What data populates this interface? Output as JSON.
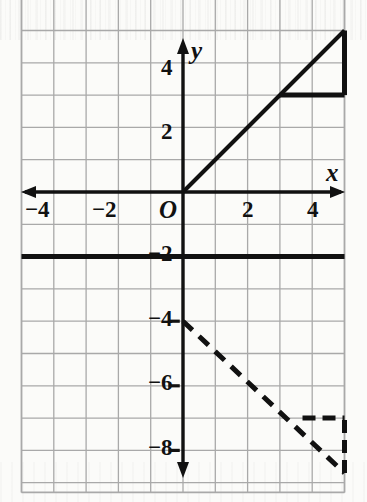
{
  "figure": {
    "kind": "coordinate-plane-graph",
    "background_color": "#fbfbf9",
    "ink_color": "#111111",
    "grid_color": "#a9a9a9"
  },
  "axes": {
    "x_axis_label": "x",
    "y_axis_label": "y",
    "origin_label": "O",
    "x_tick_labels": [
      {
        "text": "−4",
        "value": -4
      },
      {
        "text": "−2",
        "value": -2
      },
      {
        "text": "2",
        "value": 2
      },
      {
        "text": "4",
        "value": 4
      }
    ],
    "y_tick_labels": [
      {
        "text": "4",
        "value": 4
      },
      {
        "text": "2",
        "value": 2
      },
      {
        "text": "−2",
        "value": -2
      },
      {
        "text": "−4",
        "value": -4
      },
      {
        "text": "−6",
        "value": -6
      },
      {
        "text": "−8",
        "value": -8
      }
    ]
  },
  "chart_data": {
    "type": "line",
    "title": "",
    "xlabel": "x",
    "ylabel": "y",
    "xlim": [
      -5,
      5
    ],
    "ylim": [
      -9.3,
      6.4
    ],
    "grid": true,
    "grid_step": 1,
    "legend": "none",
    "series": [
      {
        "name": "solid-line-through-origin",
        "style": "solid",
        "width": 4,
        "color": "#111111",
        "points": [
          [
            0,
            0
          ],
          [
            5,
            5
          ]
        ],
        "slope": 1,
        "intercept": 0,
        "equation": "y = x"
      },
      {
        "name": "solid-slope-triangle-vertical-leg",
        "style": "solid",
        "width": 5,
        "color": "#111111",
        "points": [
          [
            5,
            3
          ],
          [
            5,
            5
          ]
        ],
        "rise": 2
      },
      {
        "name": "solid-slope-triangle-horizontal-leg",
        "style": "solid",
        "width": 5,
        "color": "#111111",
        "points": [
          [
            3,
            3
          ],
          [
            5,
            3
          ]
        ],
        "run": 2
      },
      {
        "name": "solid-horizontal-line",
        "style": "solid",
        "width": 5,
        "color": "#111111",
        "points": [
          [
            -5,
            -2
          ],
          [
            5,
            -2
          ]
        ],
        "slope": 0,
        "intercept": -2,
        "equation": "y = -2"
      },
      {
        "name": "dashed-line",
        "style": "dashed",
        "width": 5,
        "dash": [
          13,
          9
        ],
        "color": "#111111",
        "points": [
          [
            0,
            -4
          ],
          [
            5,
            -8.7
          ]
        ],
        "slope": -0.94,
        "intercept": -4,
        "equation": "y = -x - 4"
      },
      {
        "name": "dashed-slope-triangle-horizontal-leg",
        "style": "dashed",
        "width": 5,
        "dash": [
          13,
          7
        ],
        "color": "#111111",
        "points": [
          [
            3.7,
            -7
          ],
          [
            5,
            -7
          ]
        ],
        "run": 1.3
      },
      {
        "name": "dashed-slope-triangle-vertical-leg",
        "style": "dashed",
        "width": 5,
        "dash": [
          13,
          7
        ],
        "color": "#111111",
        "points": [
          [
            5,
            -8.7
          ],
          [
            5,
            -7
          ]
        ],
        "rise": 1.7
      }
    ]
  }
}
